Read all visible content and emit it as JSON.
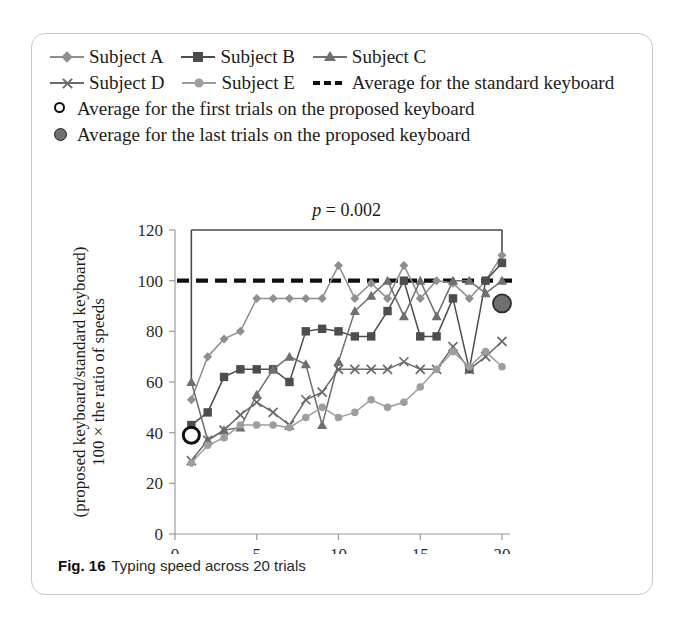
{
  "caption": {
    "fig_number": "Fig. 16",
    "text": "Typing speed across 20 trials"
  },
  "legend": {
    "rows": [
      [
        {
          "label": "Subject A",
          "marker": "diamond-marker",
          "color": "#8a8a8a"
        },
        {
          "label": "Subject B",
          "marker": "square-marker",
          "color": "#4a4a4a"
        },
        {
          "label": "Subject C",
          "marker": "triangle-marker",
          "color": "#707070"
        }
      ],
      [
        {
          "label": "Subject D",
          "marker": "cross-marker",
          "color": "#6b6b6b"
        },
        {
          "label": "Subject E",
          "marker": "circle-marker",
          "color": "#9b9b9b"
        },
        {
          "label": "Average for the standard keyboard",
          "marker": "dashed-line",
          "color": "#111111"
        }
      ],
      [
        {
          "label": "Average for the first trials on the proposed keyboard",
          "marker": "open-circle-marker",
          "color": "#111111"
        }
      ],
      [
        {
          "label": "Average for the last trials on the proposed keyboard",
          "marker": "filled-circle-marker",
          "color": "#6f6f6f"
        }
      ]
    ]
  },
  "annotation": {
    "p_symbol": "p",
    "p_rest": " = 0.002"
  },
  "chart_data": {
    "type": "line",
    "title": "Typing speed across 20 trials",
    "xlabel": "Number of trials",
    "ylabel_line1": "100 × the ratio of speeds",
    "ylabel_line2": "(proposed keyboard/standard keyboard)",
    "xlim": [
      0,
      20
    ],
    "ylim": [
      0,
      120
    ],
    "xticks": [
      0,
      5,
      10,
      15,
      20
    ],
    "yticks": [
      0,
      20,
      40,
      60,
      80,
      100,
      120
    ],
    "grid": false,
    "legend_position": "above-plot",
    "x": [
      1,
      2,
      3,
      4,
      5,
      6,
      7,
      8,
      9,
      10,
      11,
      12,
      13,
      14,
      15,
      16,
      17,
      18,
      19,
      20
    ],
    "series": [
      {
        "name": "Subject A",
        "marker": "diamond",
        "color": "#8f8f8f",
        "values": [
          53,
          70,
          77,
          80,
          93,
          93,
          93,
          93,
          93,
          106,
          93,
          99,
          93,
          106,
          93,
          100,
          99,
          93,
          100,
          110
        ]
      },
      {
        "name": "Subject B",
        "marker": "square",
        "color": "#4d4d4d",
        "values": [
          43,
          48,
          62,
          65,
          65,
          65,
          60,
          80,
          81,
          80,
          78,
          78,
          88,
          100,
          78,
          78,
          93,
          65,
          100,
          107
        ]
      },
      {
        "name": "Subject C",
        "marker": "triangle",
        "color": "#6f6f6f",
        "values": [
          60,
          37,
          41,
          42,
          55,
          65,
          70,
          67,
          43,
          68,
          88,
          94,
          100,
          86,
          100,
          86,
          100,
          100,
          95,
          100
        ]
      },
      {
        "name": "Subject D",
        "marker": "cross",
        "color": "#6b6b6b",
        "values": [
          29,
          37,
          41,
          47,
          52,
          48,
          43,
          53,
          56,
          65,
          65,
          65,
          65,
          68,
          65,
          65,
          74,
          65,
          70,
          76
        ]
      },
      {
        "name": "Subject E",
        "marker": "circle",
        "color": "#9e9e9e",
        "values": [
          28,
          35,
          38,
          43,
          43,
          43,
          42,
          46,
          50,
          46,
          48,
          53,
          50,
          52,
          58,
          65,
          72,
          66,
          72,
          66
        ]
      }
    ],
    "reference_line": {
      "name": "Average for the standard keyboard",
      "value": 100,
      "style": "dashed",
      "color": "#111111"
    },
    "highlight_points": [
      {
        "name": "Average for the first trials on the proposed keyboard",
        "x": 1,
        "y": 39,
        "style": "open-circle"
      },
      {
        "name": "Average for the last trials on the proposed keyboard",
        "x": 20,
        "y": 91,
        "style": "filled-circle"
      }
    ],
    "significance_bracket": {
      "from_x": 1,
      "to_x": 20,
      "label": "p = 0.002",
      "bracket_top": 120,
      "left_stem_bottom": 60,
      "right_stem_bottom": 108
    }
  }
}
